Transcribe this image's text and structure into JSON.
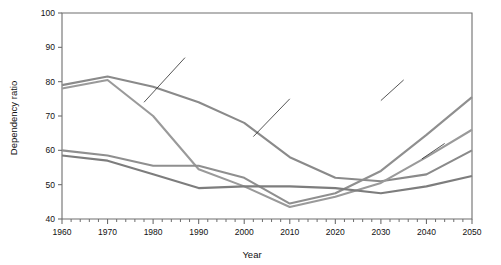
{
  "chart_data": {
    "type": "line",
    "title": "",
    "xlabel": "Year",
    "ylabel": "Dependency ratio",
    "xlim": [
      1960,
      2050
    ],
    "ylim": [
      40,
      100
    ],
    "grid": false,
    "legend": "none",
    "x_ticks": [
      1960,
      1970,
      1980,
      1990,
      2000,
      2010,
      2020,
      2030,
      2040,
      2050
    ],
    "x_tick_labels": [
      "1960",
      "1970",
      "1980",
      "1990",
      "2000",
      "2010",
      "2020",
      "2030",
      "2040",
      "2050"
    ],
    "x_minor_tick_step": 2,
    "y_ticks": [
      40,
      50,
      60,
      70,
      80,
      90,
      100
    ],
    "y_tick_labels": [
      "40",
      "50",
      "60",
      "70",
      "80",
      "90",
      "100"
    ],
    "x": [
      1960,
      1970,
      1980,
      1990,
      2000,
      2010,
      2020,
      2030,
      2040,
      2050
    ],
    "series": [
      {
        "name": "series-1",
        "color": "#8a8a8a",
        "values": [
          79.0,
          81.5,
          78.5,
          74.0,
          68.0,
          58.0,
          52.0,
          51.0,
          53.0,
          60.0
        ]
      },
      {
        "name": "series-2",
        "color": "#9a9a9a",
        "values": [
          78.0,
          80.5,
          70.0,
          54.5,
          49.5,
          43.5,
          46.5,
          50.5,
          58.0,
          66.0
        ]
      },
      {
        "name": "series-3",
        "color": "#8f8f8f",
        "values": [
          60.0,
          58.5,
          55.5,
          55.5,
          52.0,
          44.5,
          47.5,
          54.0,
          64.5,
          75.5
        ]
      },
      {
        "name": "series-4",
        "color": "#7d7d7d",
        "values": [
          58.5,
          57.0,
          53.0,
          49.0,
          49.5,
          49.5,
          49.0,
          47.5,
          49.5,
          52.5
        ]
      }
    ],
    "annotations": [
      {
        "name": "leader-line-1",
        "x1": 1978,
        "y1": 74.0,
        "x2": 1987,
        "y2": 87.0
      },
      {
        "name": "leader-line-2",
        "x1": 2002,
        "y1": 64.0,
        "x2": 2010,
        "y2": 75.0
      },
      {
        "name": "leader-line-3",
        "x1": 2030,
        "y1": 74.5,
        "x2": 2035,
        "y2": 80.5
      },
      {
        "name": "leader-line-4",
        "x1": 2039,
        "y1": 57.5,
        "x2": 2044,
        "y2": 62.0
      }
    ]
  }
}
